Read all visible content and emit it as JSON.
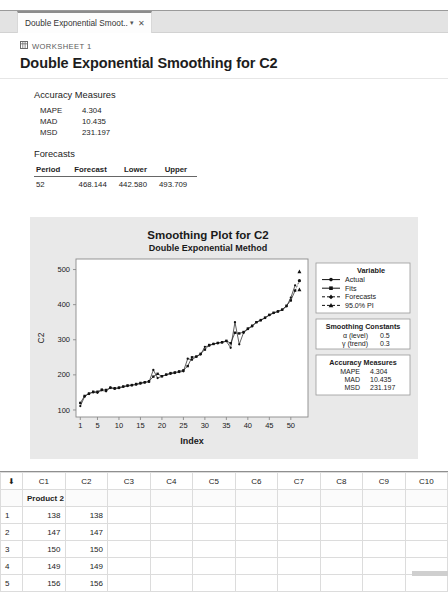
{
  "window": {
    "tab": {
      "label": "Double Exponential Smoot...",
      "caret_icon": "chevron-down-icon",
      "close_icon": "close-icon"
    }
  },
  "output": {
    "breadcrumb": {
      "icon": "worksheet-grid-icon",
      "label": "WORKSHEET 1"
    },
    "title": "Double Exponential Smoothing for C2",
    "accuracy": {
      "heading": "Accuracy Measures",
      "rows": [
        {
          "label": "MAPE",
          "value": "4.304"
        },
        {
          "label": "MAD",
          "value": "10.435"
        },
        {
          "label": "MSD",
          "value": "231.197"
        }
      ]
    },
    "forecasts": {
      "heading": "Forecasts",
      "columns": [
        "Period",
        "Forecast",
        "Lower",
        "Upper"
      ],
      "rows": [
        {
          "period": "52",
          "forecast": "468.144",
          "lower": "442.580",
          "upper": "493.709"
        }
      ]
    }
  },
  "chart_data": {
    "type": "line",
    "title": "Smoothing Plot for C2",
    "subtitle": "Double Exponential Method",
    "xlabel": "Index",
    "ylabel": "C2",
    "xlim": [
      0,
      54
    ],
    "ylim": [
      80,
      530
    ],
    "xticks": [
      1,
      5,
      10,
      15,
      20,
      25,
      30,
      35,
      40,
      45,
      50
    ],
    "yticks": [
      100,
      200,
      300,
      400,
      500
    ],
    "grid": false,
    "legend_position": "right",
    "legend": {
      "title": "Variable",
      "entries": [
        "Actual",
        "Fits",
        "Forecasts",
        "95.0% PI"
      ]
    },
    "smoothing_constants": {
      "title": "Smoothing Constants",
      "rows": [
        {
          "label": "α (level)",
          "value": "0.5"
        },
        {
          "label": "γ (trend)",
          "value": "0.3"
        }
      ]
    },
    "accuracy_box": {
      "title": "Accuracy Measures",
      "rows": [
        {
          "label": "MAPE",
          "value": "4.304"
        },
        {
          "label": "MAD",
          "value": "10.435"
        },
        {
          "label": "MSD",
          "value": "231.197"
        }
      ]
    },
    "x": [
      1,
      2,
      3,
      4,
      5,
      6,
      7,
      8,
      9,
      10,
      11,
      12,
      13,
      14,
      15,
      16,
      17,
      18,
      19,
      20,
      21,
      22,
      23,
      24,
      25,
      26,
      27,
      28,
      29,
      30,
      31,
      32,
      33,
      34,
      35,
      36,
      37,
      38,
      39,
      40,
      41,
      42,
      43,
      44,
      45,
      46,
      47,
      48,
      49,
      50,
      51
    ],
    "series": [
      {
        "name": "Actual",
        "values": [
          111,
          138,
          147,
          150,
          149,
          156,
          153,
          164,
          160,
          162,
          166,
          168,
          170,
          172,
          175,
          178,
          180,
          214,
          191,
          196,
          200,
          203,
          205,
          208,
          210,
          246,
          243,
          252,
          258,
          280,
          283,
          288,
          290,
          292,
          296,
          277,
          350,
          287,
          320,
          330,
          338,
          350,
          355,
          362,
          370,
          376,
          380,
          385,
          395,
          420,
          455
        ]
      },
      {
        "name": "Fits",
        "values": [
          120,
          140,
          146,
          152,
          152,
          158,
          157,
          163,
          162,
          164,
          167,
          170,
          171,
          174,
          177,
          179,
          182,
          195,
          203,
          196,
          201,
          205,
          207,
          210,
          213,
          225,
          250,
          252,
          260,
          272,
          285,
          288,
          291,
          293,
          297,
          290,
          320,
          318,
          322,
          332,
          340,
          350,
          356,
          363,
          371,
          377,
          381,
          386,
          397,
          412,
          440
        ]
      }
    ],
    "forecast_point": {
      "index": 52,
      "value": 468.144,
      "lower": 442.58,
      "upper": 493.709
    }
  },
  "worksheet": {
    "columns": [
      "C1",
      "C2",
      "C3",
      "C4",
      "C5",
      "C6",
      "C7",
      "C8",
      "C9",
      "C10"
    ],
    "selected_column": "C2",
    "corner_icon": "select-all-arrow-icon",
    "name_row": [
      "Product 2",
      "",
      "",
      "",
      "",
      "",
      "",
      "",
      "",
      ""
    ],
    "rows": [
      {
        "n": "1",
        "cells": [
          "138",
          "138",
          "",
          "",
          "",
          "",
          "",
          "",
          "",
          ""
        ]
      },
      {
        "n": "2",
        "cells": [
          "147",
          "147",
          "",
          "",
          "",
          "",
          "",
          "",
          "",
          ""
        ]
      },
      {
        "n": "3",
        "cells": [
          "150",
          "150",
          "",
          "",
          "",
          "",
          "",
          "",
          "",
          ""
        ]
      },
      {
        "n": "4",
        "cells": [
          "149",
          "149",
          "",
          "",
          "",
          "",
          "",
          "",
          "",
          ""
        ]
      },
      {
        "n": "5",
        "cells": [
          "156",
          "156",
          "",
          "",
          "",
          "",
          "",
          "",
          "",
          ""
        ]
      }
    ]
  }
}
